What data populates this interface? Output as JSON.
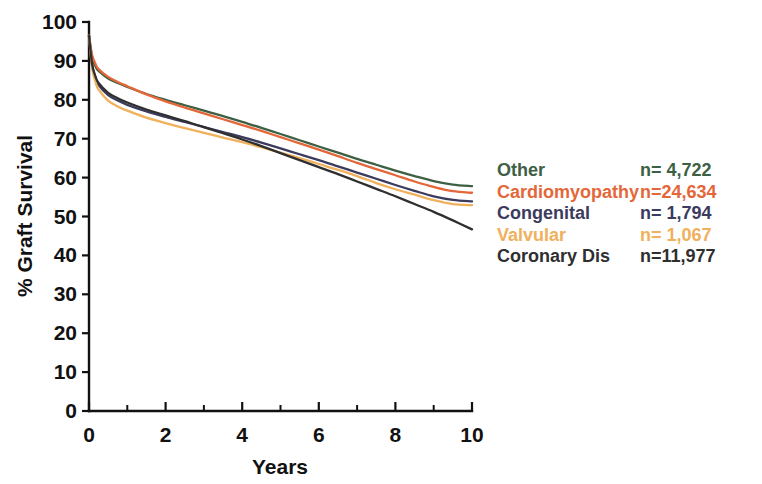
{
  "chart_data": {
    "type": "line",
    "title": "",
    "xlabel": "Years",
    "ylabel": "% Graft Survival",
    "xlim": [
      0,
      10
    ],
    "ylim": [
      0,
      100
    ],
    "grid": false,
    "legend_position": "right",
    "x_ticks_major": [
      0,
      2,
      4,
      6,
      8,
      10
    ],
    "x_tick_labels": [
      "0",
      "2",
      "4",
      "6",
      "8",
      "10"
    ],
    "x_ticks_minor": [
      1,
      3,
      5,
      7,
      9
    ],
    "y_ticks": [
      0,
      10,
      20,
      30,
      40,
      50,
      60,
      70,
      80,
      90,
      100
    ],
    "y_tick_labels": [
      "0",
      "10",
      "20",
      "30",
      "40",
      "50",
      "60",
      "70",
      "80",
      "90",
      "100"
    ],
    "x": [
      0,
      0.08,
      0.17,
      0.25,
      0.5,
      0.75,
      1,
      1.5,
      2,
      2.5,
      3,
      3.5,
      4,
      4.5,
      5,
      5.5,
      6,
      6.5,
      7,
      7.5,
      8,
      8.5,
      9,
      9.5,
      10
    ],
    "series": [
      {
        "name": "Other",
        "label": "Other",
        "n_label": "n=  4,722",
        "n": 4722,
        "color": "#3d6044",
        "values": [
          96.5,
          91.0,
          88.6,
          87.4,
          85.5,
          84.3,
          83.3,
          81.5,
          80.0,
          78.6,
          77.2,
          75.8,
          74.3,
          72.8,
          71.2,
          69.6,
          68.0,
          66.4,
          64.8,
          63.3,
          61.8,
          60.4,
          59.1,
          58.2,
          57.8
        ]
      },
      {
        "name": "Cardiomyopathy",
        "label": "Cardiomyopathy",
        "n_label": "n=24,634",
        "n": 24634,
        "color": "#e4673a",
        "values": [
          96.5,
          91.5,
          89.2,
          87.9,
          85.9,
          84.6,
          83.5,
          81.4,
          79.6,
          78.0,
          76.5,
          75.0,
          73.5,
          72.0,
          70.4,
          68.8,
          67.2,
          65.5,
          63.8,
          62.2,
          60.6,
          59.0,
          57.6,
          56.5,
          56.1
        ]
      },
      {
        "name": "Congenital",
        "label": "Congenital",
        "n_label": "n=  1,794",
        "n": 1794,
        "color": "#3b3b5e",
        "values": [
          96.5,
          89.0,
          85.6,
          83.8,
          81.2,
          79.8,
          78.7,
          77.0,
          75.6,
          74.3,
          73.0,
          71.7,
          70.4,
          69.0,
          67.5,
          66.0,
          64.5,
          62.9,
          61.3,
          59.7,
          58.1,
          56.6,
          55.2,
          54.3,
          53.9
        ]
      },
      {
        "name": "Valvular",
        "label": "Valvular",
        "n_label": "n=  1,067",
        "n": 1067,
        "color": "#f0b05c",
        "values": [
          96.5,
          88.3,
          84.6,
          82.6,
          79.8,
          78.3,
          77.2,
          75.4,
          74.0,
          72.7,
          71.5,
          70.3,
          69.1,
          67.8,
          66.4,
          65.0,
          63.5,
          62.0,
          60.4,
          58.6,
          57.0,
          55.6,
          54.2,
          53.2,
          52.9
        ]
      },
      {
        "name": "Coronary Dis",
        "label": "Coronary Dis",
        "n_label": "n=11,977",
        "n": 11977,
        "color": "#2f2f2f",
        "values": [
          96.5,
          89.2,
          86.0,
          84.3,
          81.8,
          80.4,
          79.3,
          77.5,
          76.0,
          74.5,
          73.0,
          71.4,
          69.8,
          68.1,
          66.3,
          64.5,
          62.7,
          60.9,
          59.0,
          57.1,
          55.2,
          53.2,
          51.2,
          49.0,
          46.7
        ]
      }
    ]
  }
}
